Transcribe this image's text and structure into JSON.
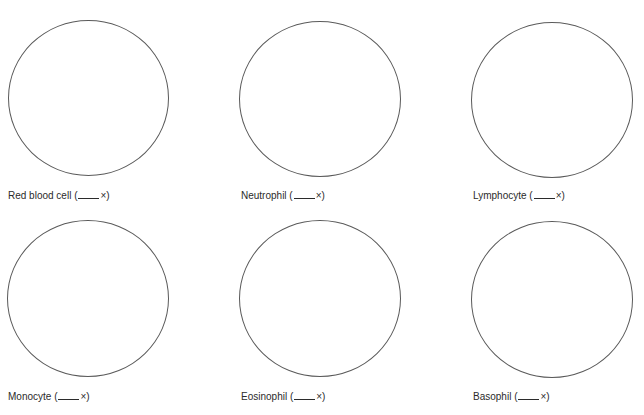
{
  "worksheet": {
    "cells": [
      {
        "name": "Red blood cell",
        "magnification_blank": "",
        "suffix": "×"
      },
      {
        "name": "Neutrophil",
        "magnification_blank": "",
        "suffix": "×"
      },
      {
        "name": "Lymphocyte",
        "magnification_blank": "",
        "suffix": "×"
      },
      {
        "name": "Monocyte",
        "magnification_blank": "",
        "suffix": "×"
      },
      {
        "name": "Eosinophil",
        "magnification_blank": "",
        "suffix": "×"
      },
      {
        "name": "Basophil",
        "magnification_blank": "",
        "suffix": "×"
      }
    ],
    "circle_stroke_color": "#5a5a5a",
    "text_color": "#2b2b2b"
  }
}
